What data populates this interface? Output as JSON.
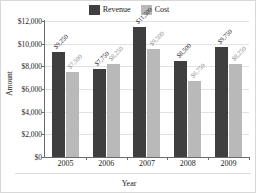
{
  "chart_data": {
    "type": "bar",
    "title": "",
    "xlabel": "Year",
    "ylabel": "Amount",
    "categories": [
      "2005",
      "2006",
      "2007",
      "2008",
      "2009"
    ],
    "series": [
      {
        "name": "Revenue",
        "color": "#3f3f3f",
        "values": [
          9250,
          7750,
          11500,
          8500,
          9750
        ],
        "labels": [
          "$9,250",
          "$7,750",
          "$11,500",
          "$8,500",
          "$9,750"
        ]
      },
      {
        "name": "Cost",
        "color": "#b9b9b9",
        "values": [
          7500,
          8250,
          9500,
          6750,
          8250
        ],
        "labels": [
          "$7,500",
          "$8,250",
          "$9,500",
          "$6,750",
          "$8,250"
        ]
      }
    ],
    "ylim": [
      0,
      12000
    ],
    "yticks": [
      0,
      2000,
      4000,
      6000,
      8000,
      10000,
      12000
    ],
    "ytick_labels": [
      "$0",
      "$2,000",
      "$4,000",
      "$6,000",
      "$8,000",
      "$10,000",
      "$12,000"
    ],
    "grid": true,
    "legend_position": "top-center"
  },
  "legend": {
    "entries": [
      {
        "label": "Revenue",
        "color": "#3f3f3f"
      },
      {
        "label": "Cost",
        "color": "#b9b9b9"
      }
    ]
  }
}
